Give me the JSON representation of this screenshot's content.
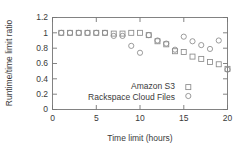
{
  "chart_data": {
    "type": "scatter",
    "title": "",
    "xlabel": "Time limit (hours)",
    "ylabel": "Runtime/time limit ratio",
    "xlim": [
      0,
      20
    ],
    "ylim": [
      0,
      1.2
    ],
    "xticks": [
      "0",
      "5",
      "10",
      "15",
      "20"
    ],
    "xtick_values": [
      0,
      5,
      10,
      15,
      20
    ],
    "yticks": [
      "0",
      "0.2",
      "0.4",
      "0.6",
      "0.8",
      "1",
      "1.2"
    ],
    "ytick_values": [
      0,
      0.2,
      0.4,
      0.6,
      0.8,
      1.0,
      1.2
    ],
    "grid": false,
    "legend_position": "inside-lower-center",
    "series": [
      {
        "name": "Amazon S3",
        "marker": "square",
        "x": [
          1,
          2,
          3,
          4,
          5,
          6,
          7,
          8,
          9,
          10,
          11,
          12,
          13,
          14,
          15,
          16,
          17,
          18,
          19,
          20
        ],
        "values": [
          1.0,
          1.0,
          1.0,
          1.0,
          1.0,
          1.0,
          0.99,
          0.99,
          1.0,
          1.0,
          0.97,
          0.89,
          0.85,
          0.76,
          0.75,
          0.69,
          0.66,
          0.62,
          0.59,
          0.53
        ]
      },
      {
        "name": "Rackspace Cloud Files",
        "marker": "circle",
        "x": [
          1,
          2,
          3,
          4,
          5,
          6,
          7,
          8,
          9,
          10,
          11,
          12,
          13,
          14,
          15,
          16,
          17,
          18,
          19,
          20
        ],
        "values": [
          1.0,
          1.0,
          1.0,
          1.0,
          1.0,
          1.0,
          0.96,
          0.96,
          0.83,
          0.74,
          0.97,
          0.9,
          0.86,
          0.78,
          0.95,
          0.89,
          0.84,
          0.79,
          0.9,
          0.52
        ]
      }
    ]
  },
  "legend": {
    "entries": [
      {
        "label": "Amazon S3",
        "marker": "square"
      },
      {
        "label": "Rackspace Cloud Files",
        "marker": "circle"
      }
    ]
  },
  "colors": {
    "axis": "#767676",
    "text": "#3a3a3a",
    "marker": "#8a8a8a",
    "background": "#ffffff"
  }
}
